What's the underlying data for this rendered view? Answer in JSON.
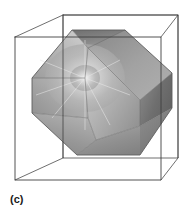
{
  "figure": {
    "label": "(c)",
    "caption_position": "bottom-left",
    "background_color": "#ffffff",
    "wireframe": {
      "name": "cube-wireframe",
      "stroke_color": "#4a4a4a",
      "stroke_width": 0.8,
      "vertices": {
        "front_top_left": [
          15,
          37
        ],
        "front_top_right": [
          161,
          37
        ],
        "front_bottom_left": [
          15,
          180
        ],
        "front_bottom_right": [
          161,
          180
        ],
        "back_top_left": [
          63,
          15
        ],
        "back_top_right": [
          178,
          15
        ],
        "back_bottom_left": [
          63,
          158
        ],
        "back_bottom_right": [
          178,
          158
        ]
      }
    },
    "polyhedron": {
      "name": "cuboctahedron",
      "silhouette": [
        [
          72,
          30
        ],
        [
          125,
          30
        ],
        [
          172,
          73
        ],
        [
          172,
          108
        ],
        [
          140,
          155
        ],
        [
          77,
          155
        ],
        [
          32,
          113
        ],
        [
          32,
          78
        ]
      ],
      "highlight_point": [
        85,
        78
      ],
      "facet_colors": {
        "top": "#7e7e7e",
        "upper_left": "#b4b4b4",
        "upper_right": "#9c9c9c",
        "right_dark": "#6e6e6e",
        "left_mid": "#a6a6a6",
        "center": "#b0b0b0",
        "lower_left": "#8c8c8c",
        "lower_right": "#787878",
        "bottom": "#9a9a9a",
        "highlight": "#f2f2f2"
      },
      "edge_color": "#5a5a5a"
    }
  }
}
